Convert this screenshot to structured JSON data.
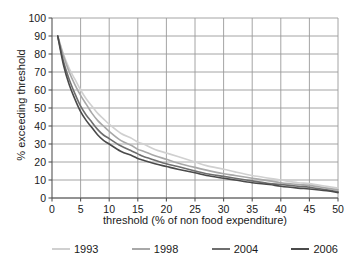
{
  "chart_data": {
    "type": "line",
    "title": "",
    "subtitle": "",
    "xlabel": "threshold (% of non food expenditure)",
    "ylabel": "% exceeding threshold",
    "xlim": [
      0,
      50
    ],
    "ylim": [
      0,
      100
    ],
    "xticks": [
      0,
      5,
      10,
      15,
      20,
      25,
      30,
      35,
      40,
      45,
      50
    ],
    "yticks": [
      0,
      10,
      20,
      30,
      40,
      50,
      60,
      70,
      80,
      90,
      100
    ],
    "grid": "both",
    "legend_position": "bottom",
    "x": [
      1,
      2,
      3,
      4,
      5,
      6,
      7,
      8,
      9,
      10,
      12,
      14,
      15,
      16,
      18,
      20,
      22,
      25,
      27,
      30,
      32,
      35,
      38,
      40,
      43,
      45,
      48,
      50
    ],
    "series": [
      {
        "name": "1993",
        "color": "#d0d0d0",
        "values": [
          90,
          80,
          72,
          66,
          60,
          55,
          51,
          47,
          44,
          41,
          36,
          33,
          31,
          30,
          27,
          25,
          23,
          20,
          18,
          16,
          14.5,
          12.5,
          11,
          10,
          8.5,
          8,
          6.5,
          5.5
        ]
      },
      {
        "name": "1998",
        "color": "#a8a8a8",
        "values": [
          90,
          79,
          70,
          63,
          57,
          52,
          47,
          43,
          40,
          37,
          32,
          29,
          27,
          26,
          23.5,
          21.5,
          19.5,
          17,
          15.5,
          13.5,
          12.5,
          11,
          9.5,
          8.5,
          7.5,
          7,
          5.5,
          4.5
        ]
      },
      {
        "name": "2004",
        "color": "#6e6e6e",
        "values": [
          90,
          76,
          66,
          58,
          51,
          46,
          42,
          38,
          35,
          33,
          29,
          26,
          24.5,
          23,
          21,
          19,
          17.5,
          15,
          13.5,
          12,
          11,
          9.5,
          8,
          7.5,
          6.5,
          6,
          4.5,
          3.5
        ]
      },
      {
        "name": "2006",
        "color": "#4a4a4a",
        "values": [
          90,
          74,
          63,
          55,
          48,
          43,
          39,
          35,
          32,
          30,
          26,
          23.5,
          22,
          21,
          19,
          17.5,
          16,
          14,
          12.5,
          11,
          10,
          8.5,
          7.5,
          6.5,
          5.5,
          5,
          4,
          3
        ]
      }
    ]
  },
  "legend": {
    "items": [
      {
        "label": "1993"
      },
      {
        "label": "1998"
      },
      {
        "label": "2004"
      },
      {
        "label": "2006"
      }
    ]
  },
  "axes": {
    "colors": {
      "grid": "#9a9a9a",
      "axis": "#555555",
      "text": "#1a1a1a",
      "background": "#ffffff"
    }
  }
}
